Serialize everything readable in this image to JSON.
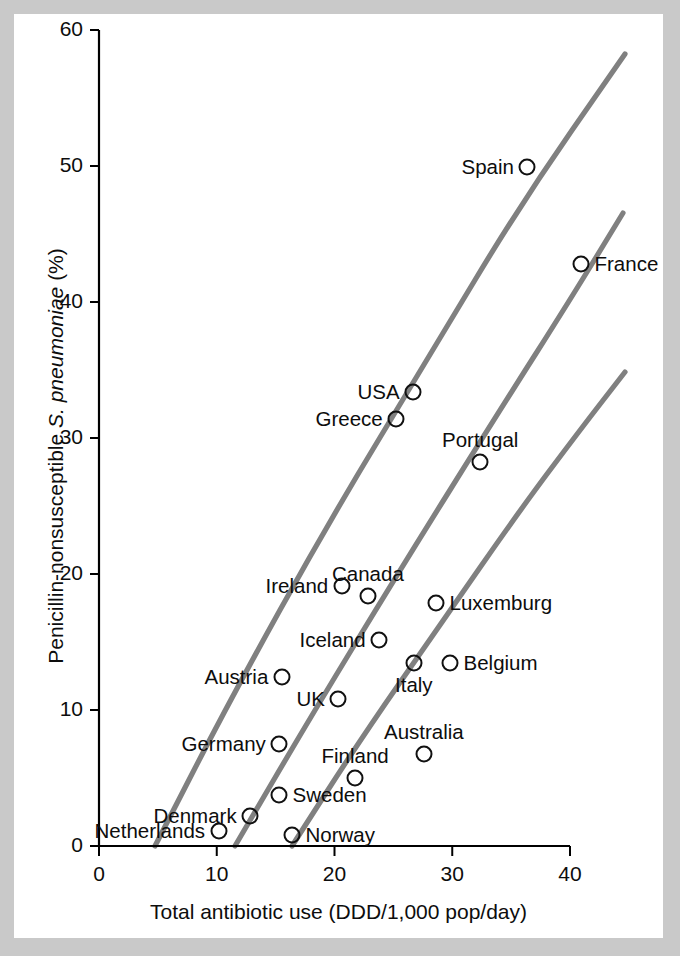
{
  "chart_data": {
    "type": "scatter",
    "title": "",
    "xlabel": "Total antibiotic use (DDD/1,000 pop/day)",
    "ylabel_plain": "Penicillin-nonsusceptible S. pneumoniae (%)",
    "ylabel_prefix": "Penicillin-nonsusceptible ",
    "ylabel_italic": "S. pneumoniae",
    "ylabel_suffix": " (%)",
    "xlim": [
      0,
      40
    ],
    "ylim": [
      0,
      60
    ],
    "xticks": [
      0,
      10,
      20,
      30,
      40
    ],
    "yticks": [
      0,
      10,
      20,
      30,
      40,
      50,
      60
    ],
    "xtick_labels": [
      "0",
      "10",
      "20",
      "30",
      "40"
    ],
    "ytick_labels": [
      "0",
      "10",
      "20",
      "30",
      "40",
      "50",
      "60"
    ],
    "grid": false,
    "legend": "none",
    "marker_style": "open-circle",
    "point_color": "#111111",
    "trend_color": "#808080",
    "panel_color": "#ffffff",
    "background_color": "#c9c9c9",
    "points": [
      {
        "label": "Spain",
        "x": 36.3,
        "y": 50.0,
        "px": 527,
        "py": 167,
        "label_side": "left"
      },
      {
        "label": "France",
        "x": 41.0,
        "y": 42.8,
        "px": 581,
        "py": 264,
        "label_side": "right"
      },
      {
        "label": "USA",
        "x": 26.7,
        "y": 33.5,
        "px": 413,
        "py": 392,
        "label_side": "left"
      },
      {
        "label": "Greece",
        "x": 25.2,
        "y": 31.3,
        "px": 396,
        "py": 419,
        "label_side": "left"
      },
      {
        "label": "Portugal",
        "x": 32.4,
        "y": 28.2,
        "px": 480,
        "py": 462,
        "label_side": "above"
      },
      {
        "label": "Ireland",
        "x": 20.6,
        "y": 19.1,
        "px": 342,
        "py": 586,
        "label_side": "left"
      },
      {
        "label": "Canada",
        "x": 22.9,
        "y": 18.4,
        "px": 368,
        "py": 596,
        "label_side": "above"
      },
      {
        "label": "Luxemburg",
        "x": 28.6,
        "y": 17.9,
        "px": 436,
        "py": 603,
        "label_side": "right"
      },
      {
        "label": "Iceland",
        "x": 23.8,
        "y": 15.1,
        "px": 379,
        "py": 640,
        "label_side": "left"
      },
      {
        "label": "Italy",
        "x": 26.8,
        "y": 13.5,
        "px": 414,
        "py": 663,
        "label_side": "below"
      },
      {
        "label": "Belgium",
        "x": 29.8,
        "y": 13.5,
        "px": 450,
        "py": 663,
        "label_side": "right"
      },
      {
        "label": "Austria",
        "x": 15.5,
        "y": 12.4,
        "px": 282,
        "py": 677,
        "label_side": "left"
      },
      {
        "label": "UK",
        "x": 20.3,
        "y": 10.6,
        "px": 338,
        "py": 699,
        "label_side": "left"
      },
      {
        "label": "Germany",
        "x": 15.3,
        "y": 7.3,
        "px": 279,
        "py": 744,
        "label_side": "left"
      },
      {
        "label": "Australia",
        "x": 27.6,
        "y": 6.7,
        "px": 424,
        "py": 754,
        "label_side": "above"
      },
      {
        "label": "Finland",
        "x": 21.7,
        "y": 4.8,
        "px": 355,
        "py": 778,
        "label_side": "above"
      },
      {
        "label": "Sweden",
        "x": 15.3,
        "y": 3.7,
        "px": 279,
        "py": 795,
        "label_side": "right"
      },
      {
        "label": "Denmark",
        "x": 12.8,
        "y": 2.2,
        "px": 250,
        "py": 816,
        "label_side": "left"
      },
      {
        "label": "Netherlands",
        "x": 10.2,
        "y": 1.2,
        "px": 219,
        "py": 831,
        "label_side": "left"
      },
      {
        "label": "Norway",
        "x": 16.3,
        "y": 0.8,
        "px": 292,
        "py": 835,
        "label_side": "right"
      }
    ],
    "trend_lines": [
      {
        "name": "upper-trend",
        "points_px": [
          [
            155,
            846
          ],
          [
            230,
            700
          ],
          [
            330,
            520
          ],
          [
            430,
            355
          ],
          [
            520,
            205
          ],
          [
            625,
            54
          ]
        ]
      },
      {
        "name": "middle-trend",
        "points_px": [
          [
            235,
            846
          ],
          [
            310,
            718
          ],
          [
            400,
            570
          ],
          [
            500,
            410
          ],
          [
            570,
            300
          ],
          [
            623,
            213
          ]
        ]
      },
      {
        "name": "lower-trend",
        "points_px": [
          [
            292,
            846
          ],
          [
            360,
            740
          ],
          [
            440,
            625
          ],
          [
            520,
            510
          ],
          [
            580,
            430
          ],
          [
            625,
            372
          ]
        ]
      }
    ]
  },
  "axis": {
    "x_title": "Total antibiotic use (DDD/1,000 pop/day)",
    "y_title_prefix": "Penicillin-nonsusceptible ",
    "y_title_italic": "S. pneumoniae",
    "y_title_suffix": " (%)"
  }
}
